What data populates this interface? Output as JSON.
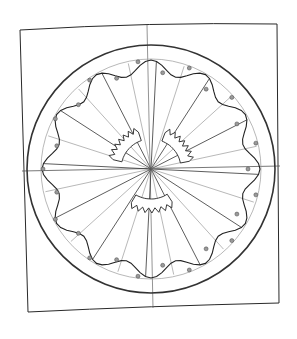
{
  "diagram": {
    "style": "pencil sketch",
    "center": [
      151,
      169
    ],
    "outer_circle_radius": 124,
    "inner_thin_circle_radius": 110,
    "wavy_ring": {
      "base_radius": 108,
      "amplitude": 7,
      "waves": 12
    },
    "spokes": 24,
    "dots": 26,
    "gear_fragments": 3,
    "colors": {
      "stroke": "#2a2a2a",
      "light_stroke": "#8a8a8a",
      "paper": "#ffffff",
      "dot_fill": "#9a9a9a"
    }
  }
}
